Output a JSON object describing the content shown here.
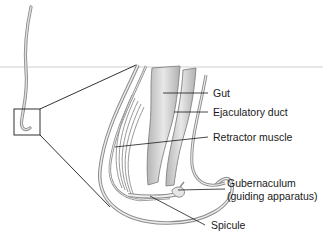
{
  "figure": {
    "labels": {
      "gut": "Gut",
      "ejaculatory_duct": "Ejaculatory duct",
      "retractor_muscle": "Retractor muscle",
      "gubernaculum_line1": "Gubernaculum",
      "gubernaculum_line2": "(guiding apparatus)",
      "spicule": "Spicule"
    },
    "colors": {
      "outline": "#8c8c8c",
      "fill_light": "#e6e6e6",
      "fill_dark": "#b8b8b8",
      "leader": "#1a1a1a",
      "divider": "#c8c8c8"
    }
  }
}
